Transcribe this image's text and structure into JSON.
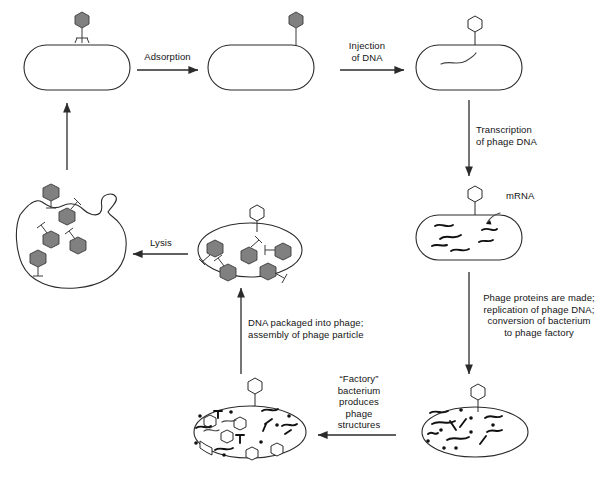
{
  "diagram": {
    "colors": {
      "phage_head_filled": "#808080",
      "phage_head_empty": "#ffffff",
      "stroke": "#2b2b2b",
      "background": "#ffffff"
    }
  },
  "labels": {
    "adsorption": "Adsorption",
    "injection": "Injection\nof DNA",
    "transcription": "Transcription\nof phage DNA",
    "mrna": "mRNA",
    "proteins": "Phage proteins are made;\nreplication of phage DNA;\nconversion of bacterium\nto phage factory",
    "factory": "“Factory”\nbacterium\nproduces\nphage\nstructures",
    "packaging": "DNA packaged into phage;\nassembly of phage particle",
    "lysis": "Lysis"
  },
  "stages": [
    {
      "id": "free-bacterium",
      "name": "Uninfected bacterium with free phage",
      "phage_count": 1,
      "phage_state": "free"
    },
    {
      "id": "adsorbed-bacterium",
      "name": "Bacterium with phage attached",
      "phage_count": 1,
      "phage_state": "attached"
    },
    {
      "id": "injected-bacterium",
      "name": "Bacterium with injected phage DNA",
      "phage_count": 1,
      "phage_state": "empty-head"
    },
    {
      "id": "transcribing-bacterium",
      "name": "Bacterium transcribing mRNA",
      "phage_count": 1,
      "phage_state": "empty-head"
    },
    {
      "id": "factory-bacterium",
      "name": "Factory bacterium replicating DNA",
      "phage_count": 1,
      "phage_state": "empty-head"
    },
    {
      "id": "assembling-bacterium",
      "name": "Bacterium assembling phage structures",
      "phage_count": 1,
      "phage_state": "empty-head"
    },
    {
      "id": "packaged-bacterium",
      "name": "Bacterium with completed phage particles",
      "phage_count": 5,
      "phage_state": "filled"
    },
    {
      "id": "lysed-bacterium",
      "name": "Lysed bacterium releasing phage",
      "phage_count": 5,
      "phage_state": "released"
    }
  ],
  "arrows": [
    {
      "from": "free-bacterium",
      "to": "adsorbed-bacterium",
      "label": "Adsorption",
      "direction": "right"
    },
    {
      "from": "adsorbed-bacterium",
      "to": "injected-bacterium",
      "label": "Injection of DNA",
      "direction": "right"
    },
    {
      "from": "injected-bacterium",
      "to": "transcribing-bacterium",
      "label": "Transcription of phage DNA",
      "direction": "down"
    },
    {
      "from": "transcribing-bacterium",
      "to": "factory-bacterium",
      "label": "Phage proteins are made; replication of phage DNA; conversion of bacterium to phage factory",
      "direction": "down"
    },
    {
      "from": "factory-bacterium",
      "to": "assembling-bacterium",
      "label": "“Factory” bacterium produces phage structures",
      "direction": "left"
    },
    {
      "from": "assembling-bacterium",
      "to": "packaged-bacterium",
      "label": "DNA packaged into phage; assembly of phage particle",
      "direction": "up"
    },
    {
      "from": "packaged-bacterium",
      "to": "lysed-bacterium",
      "label": "Lysis",
      "direction": "left"
    },
    {
      "from": "lysed-bacterium",
      "to": "free-bacterium",
      "label": "",
      "direction": "up"
    }
  ]
}
